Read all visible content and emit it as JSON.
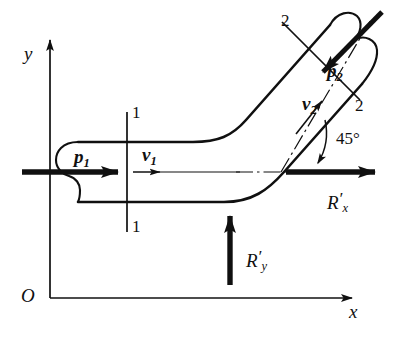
{
  "figure": {
    "background_color": "#ffffff",
    "line_color": "#101010"
  },
  "axes": {
    "origin_label": "O",
    "y_label": "y",
    "x_label": "x"
  },
  "sections": {
    "inlet_top_label": "1",
    "inlet_bottom_label": "1",
    "outlet_upper_label": "2",
    "outlet_lower_label": "2"
  },
  "inlet": {
    "pressure_label": "p",
    "pressure_sub": "1",
    "velocity_label": "v",
    "velocity_sub": "1"
  },
  "outlet": {
    "pressure_label": "p",
    "pressure_sub": "2",
    "velocity_label": "v",
    "velocity_sub": "2"
  },
  "angle": {
    "value": "45",
    "unit": "°",
    "text": "45°"
  },
  "reactions": {
    "rx_label": "R",
    "rx_prime": "′",
    "rx_sub": "x",
    "ry_label": "R",
    "ry_prime": "′",
    "ry_sub": "y"
  }
}
